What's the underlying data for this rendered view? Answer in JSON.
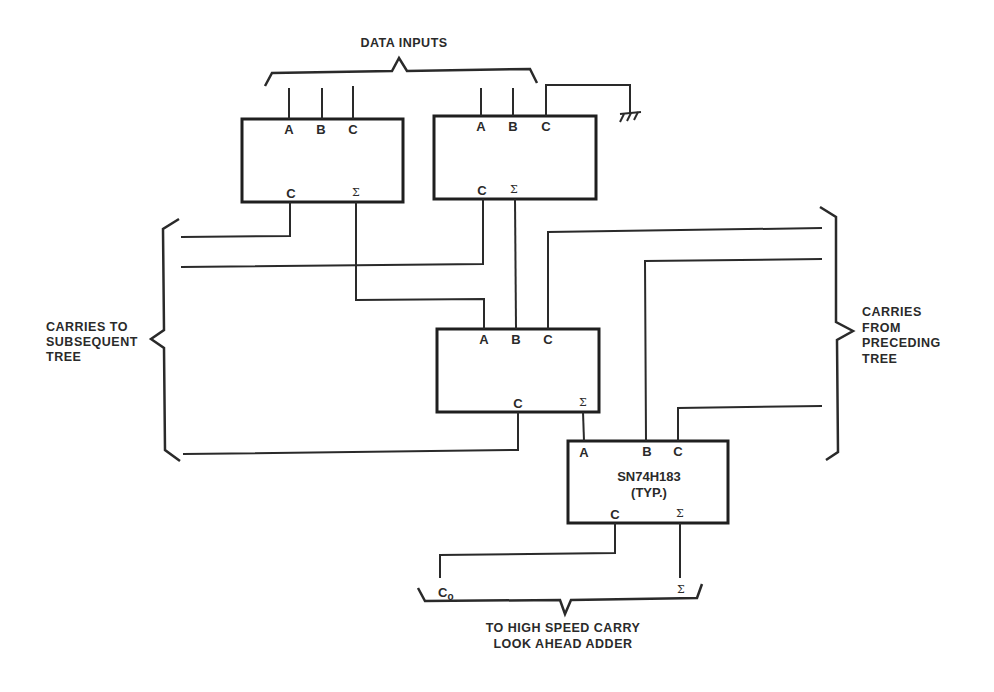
{
  "labels": {
    "data_inputs": "DATA INPUTS",
    "carries_to": [
      "CARRIES TO",
      "SUBSEQUENT",
      "TREE"
    ],
    "carries_from": [
      "CARRIES",
      "FROM",
      "PRECEDING",
      "TREE"
    ],
    "output_caption": [
      "TO HIGH SPEED CARRY",
      "LOOK AHEAD ADDER"
    ],
    "output_carry": "C",
    "output_carry_sub": "o",
    "output_sum": "Σ"
  },
  "adders": [
    {
      "id": "adder-1",
      "inputs": [
        "A",
        "B",
        "C"
      ],
      "outputs": [
        "C",
        "Σ"
      ]
    },
    {
      "id": "adder-2",
      "inputs": [
        "A",
        "B",
        "C"
      ],
      "outputs": [
        "C",
        "Σ"
      ],
      "c_input": "ground"
    },
    {
      "id": "adder-3",
      "inputs": [
        "A",
        "B",
        "C"
      ],
      "outputs": [
        "C",
        "Σ"
      ]
    },
    {
      "id": "adder-4",
      "inputs": [
        "A",
        "B",
        "C"
      ],
      "outputs": [
        "C",
        "Σ"
      ],
      "part_number": "SN74H183",
      "part_note": "(TYP.)"
    }
  ],
  "colors": {
    "line": "#2a2a2a",
    "background": "#ffffff"
  }
}
